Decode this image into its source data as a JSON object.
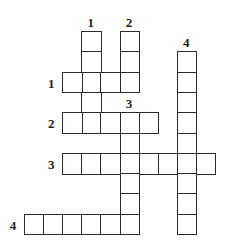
{
  "puzzle": {
    "type": "crossword",
    "grid_origin": {
      "x": 24,
      "y": 31
    },
    "cell_w": 19.1,
    "cell_h": 20.3,
    "words": [
      {
        "direction": "down",
        "number": "1",
        "col": 3,
        "row": 0,
        "length": 5
      },
      {
        "direction": "down",
        "number": "2",
        "col": 5,
        "row": 0,
        "length": 3
      },
      {
        "direction": "down",
        "number": "3",
        "col": 5,
        "row": 4,
        "length": 6
      },
      {
        "direction": "down",
        "number": "4",
        "col": 8,
        "row": 1,
        "length": 9
      },
      {
        "direction": "across",
        "number": "1",
        "col": 2,
        "row": 2,
        "length": 4
      },
      {
        "direction": "across",
        "number": "2",
        "col": 2,
        "row": 4,
        "length": 5
      },
      {
        "direction": "across",
        "number": "3",
        "col": 2,
        "row": 6,
        "length": 8
      },
      {
        "direction": "across",
        "number": "4",
        "col": 0,
        "row": 9,
        "length": 6
      }
    ]
  }
}
